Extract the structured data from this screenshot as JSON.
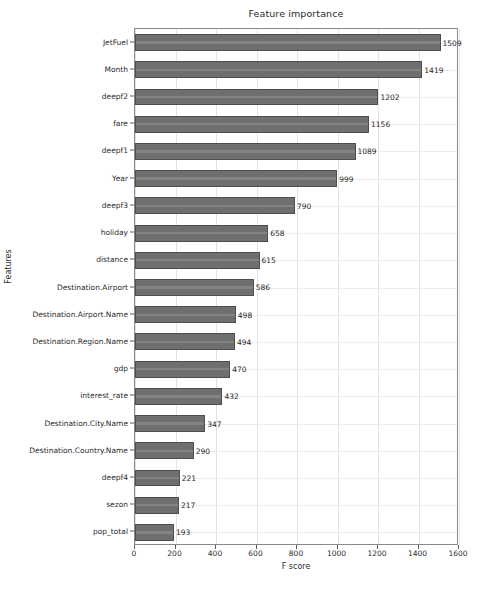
{
  "chart_data": {
    "type": "bar",
    "orientation": "horizontal",
    "title": "Feature importance",
    "xlabel": "F score",
    "ylabel": "Features",
    "xlim": [
      0,
      1600
    ],
    "ylim": [
      0,
      19
    ],
    "grid": true,
    "legend": "none",
    "xticks": [
      "0",
      "200",
      "400",
      "600",
      "800",
      "1000",
      "1200",
      "1400",
      "1600"
    ],
    "xtick_values": [
      0,
      200,
      400,
      600,
      800,
      1000,
      1200,
      1400,
      1600
    ],
    "categories": [
      "JetFuel",
      "Month",
      "deepf2",
      "fare",
      "deepf1",
      "Year",
      "deepf3",
      "holiday",
      "distance",
      "Destination.Airport",
      "Destination.Airport.Name",
      "Destination.Region.Name",
      "gdp",
      "interest_rate",
      "Destination.City.Name",
      "Destination.Country.Name",
      "deepf4",
      "sezon",
      "pop_total"
    ],
    "values": [
      1509,
      1419,
      1202,
      1156,
      1089,
      999,
      790,
      658,
      615,
      586,
      498,
      494,
      470,
      432,
      347,
      290,
      221,
      217,
      193
    ],
    "value_labels": [
      "1509",
      "1419",
      "1202",
      "1156",
      "1089",
      "999",
      "790",
      "658",
      "615",
      "586",
      "498",
      "494",
      "470",
      "432",
      "347",
      "290",
      "221",
      "217",
      "193"
    ],
    "bar_color": "#6f6f6f",
    "bar_edge_color": "#4e4e4e",
    "grid_color": "#e2e2e2",
    "axes_color": "#8a8a8a",
    "background_color": "#ffffff",
    "text_color": "#2b2b2b"
  }
}
